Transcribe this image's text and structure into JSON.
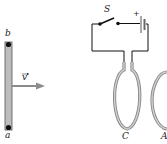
{
  "figure": {
    "left_panel": {
      "rod": {
        "top_label": "b",
        "bottom_label": "a",
        "fill_color": "#b8b8b8",
        "endpoint_color": "#111111"
      },
      "velocity": {
        "label": "v",
        "arrow_color": "#8c8c8c",
        "direction": "right"
      }
    },
    "right_panel": {
      "switch_label": "S",
      "battery_polarity": "+",
      "loops": [
        {
          "label": "C"
        },
        {
          "label": "A"
        }
      ],
      "wire_color": "#111111",
      "loop_color": "#a0a0a0"
    }
  }
}
